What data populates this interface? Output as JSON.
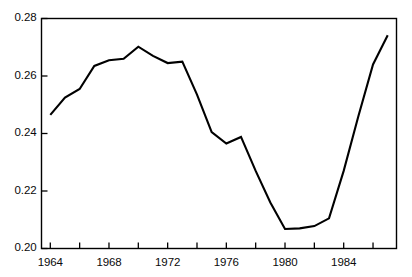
{
  "chart_data": {
    "type": "line",
    "title": "",
    "subtitle": "",
    "xlabel": "",
    "ylabel": "",
    "xlim": [
      1963.4,
      1987.6
    ],
    "ylim": [
      0.2,
      0.28
    ],
    "grid": false,
    "legend": null,
    "line_color": "#000000",
    "frame_color": "#000000",
    "background_color": "#ffffff",
    "y_ticks": [
      0.2,
      0.22,
      0.24,
      0.26,
      0.28
    ],
    "y_ticklabels": [
      "0.20",
      "0.22",
      "0.24",
      "0.26",
      "0.28"
    ],
    "x_ticks": [
      1964,
      1966,
      1968,
      1970,
      1972,
      1974,
      1976,
      1978,
      1980,
      1982,
      1984,
      1986
    ],
    "x_ticklabels_shown": [
      {
        "value": 1964,
        "label": "1964"
      },
      {
        "value": 1968,
        "label": "1968"
      },
      {
        "value": 1972,
        "label": "1972"
      },
      {
        "value": 1976,
        "label": "1976"
      },
      {
        "value": 1980,
        "label": "1980"
      },
      {
        "value": 1984,
        "label": "1984"
      }
    ],
    "x": [
      1964,
      1965,
      1966,
      1967,
      1968,
      1969,
      1970,
      1971,
      1972,
      1973,
      1974,
      1975,
      1976,
      1977,
      1978,
      1979,
      1980,
      1981,
      1982,
      1983,
      1984,
      1985,
      1986,
      1987
    ],
    "series": [
      {
        "name": "value",
        "values": [
          0.2465,
          0.2525,
          0.2555,
          0.2635,
          0.2655,
          0.266,
          0.2702,
          0.267,
          0.2645,
          0.265,
          0.2535,
          0.2405,
          0.2365,
          0.2388,
          0.227,
          0.216,
          0.2068,
          0.207,
          0.2078,
          0.2105,
          0.227,
          0.246,
          0.264,
          0.2742
        ]
      }
    ]
  }
}
